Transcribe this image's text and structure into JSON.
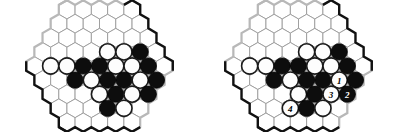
{
  "figure": {
    "board_count": 2,
    "colors": {
      "black_stone": "#0d0d0d",
      "white_stone": "#fdfdfd",
      "cell_fill": "#ffffff",
      "cell_stroke": "#9a9a9a",
      "dark_edge": "#111111",
      "light_edge": "#b8b8b8",
      "background": "#ffffff"
    },
    "geometry": {
      "rows": 9,
      "row_lengths": [
        5,
        6,
        7,
        8,
        9,
        8,
        7,
        6,
        5
      ],
      "hex_radius": 9.4,
      "orientation": "pointy-top-rows"
    },
    "boards": [
      {
        "label": "left-board",
        "caption": "",
        "stones": [
          {
            "row": 3,
            "col": 4,
            "color": "white",
            "number": ""
          },
          {
            "row": 3,
            "col": 5,
            "color": "white",
            "number": ""
          },
          {
            "row": 3,
            "col": 6,
            "color": "black",
            "number": ""
          },
          {
            "row": 4,
            "col": 1,
            "color": "white",
            "number": ""
          },
          {
            "row": 4,
            "col": 2,
            "color": "white",
            "number": ""
          },
          {
            "row": 4,
            "col": 3,
            "color": "black",
            "number": ""
          },
          {
            "row": 4,
            "col": 4,
            "color": "black",
            "number": ""
          },
          {
            "row": 4,
            "col": 5,
            "color": "white",
            "number": ""
          },
          {
            "row": 4,
            "col": 6,
            "color": "white",
            "number": ""
          },
          {
            "row": 4,
            "col": 7,
            "color": "black",
            "number": ""
          },
          {
            "row": 5,
            "col": 2,
            "color": "black",
            "number": ""
          },
          {
            "row": 5,
            "col": 3,
            "color": "white",
            "number": ""
          },
          {
            "row": 5,
            "col": 4,
            "color": "black",
            "number": ""
          },
          {
            "row": 5,
            "col": 5,
            "color": "black",
            "number": ""
          },
          {
            "row": 5,
            "col": 6,
            "color": "white",
            "number": ""
          },
          {
            "row": 5,
            "col": 7,
            "color": "black",
            "number": ""
          },
          {
            "row": 6,
            "col": 3,
            "color": "white",
            "number": ""
          },
          {
            "row": 6,
            "col": 4,
            "color": "black",
            "number": ""
          },
          {
            "row": 6,
            "col": 5,
            "color": "white",
            "number": ""
          },
          {
            "row": 6,
            "col": 6,
            "color": "black",
            "number": ""
          },
          {
            "row": 7,
            "col": 3,
            "color": "black",
            "number": ""
          },
          {
            "row": 7,
            "col": 4,
            "color": "white",
            "number": ""
          }
        ]
      },
      {
        "label": "right-board",
        "caption": "",
        "stones": [
          {
            "row": 3,
            "col": 4,
            "color": "white",
            "number": ""
          },
          {
            "row": 3,
            "col": 5,
            "color": "white",
            "number": ""
          },
          {
            "row": 3,
            "col": 6,
            "color": "black",
            "number": ""
          },
          {
            "row": 4,
            "col": 1,
            "color": "white",
            "number": ""
          },
          {
            "row": 4,
            "col": 2,
            "color": "white",
            "number": ""
          },
          {
            "row": 4,
            "col": 3,
            "color": "black",
            "number": ""
          },
          {
            "row": 4,
            "col": 4,
            "color": "black",
            "number": ""
          },
          {
            "row": 4,
            "col": 5,
            "color": "white",
            "number": ""
          },
          {
            "row": 4,
            "col": 6,
            "color": "white",
            "number": ""
          },
          {
            "row": 4,
            "col": 7,
            "color": "black",
            "number": ""
          },
          {
            "row": 5,
            "col": 2,
            "color": "black",
            "number": ""
          },
          {
            "row": 5,
            "col": 3,
            "color": "white",
            "number": ""
          },
          {
            "row": 5,
            "col": 4,
            "color": "black",
            "number": ""
          },
          {
            "row": 5,
            "col": 5,
            "color": "black",
            "number": ""
          },
          {
            "row": 5,
            "col": 6,
            "color": "white",
            "number": "1"
          },
          {
            "row": 5,
            "col": 7,
            "color": "black",
            "number": ""
          },
          {
            "row": 6,
            "col": 3,
            "color": "white",
            "number": ""
          },
          {
            "row": 6,
            "col": 4,
            "color": "black",
            "number": ""
          },
          {
            "row": 6,
            "col": 5,
            "color": "white",
            "number": "3"
          },
          {
            "row": 6,
            "col": 6,
            "color": "black",
            "number": "2"
          },
          {
            "row": 7,
            "col": 2,
            "color": "white",
            "number": "4"
          },
          {
            "row": 7,
            "col": 3,
            "color": "black",
            "number": ""
          },
          {
            "row": 7,
            "col": 4,
            "color": "white",
            "number": ""
          }
        ],
        "move_markers": [
          {
            "number": "1",
            "color": "white"
          },
          {
            "number": "2",
            "color": "black"
          },
          {
            "number": "3",
            "color": "white"
          },
          {
            "number": "4",
            "color": "white"
          }
        ]
      }
    ]
  }
}
